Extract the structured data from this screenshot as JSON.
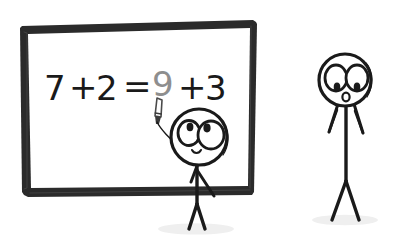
{
  "scene": {
    "title": "Stick figure writing math on a whiteboard",
    "background_color": "#ffffff",
    "width": 400,
    "height": 244
  },
  "whiteboard": {
    "label": "whiteboard",
    "frame_color": "#2b2b2b",
    "surface_color": "#ffffff",
    "equation": {
      "full_text": "7 + 2 = 9 + 3",
      "tokens": [
        {
          "text": "7",
          "state": "written",
          "color": "#1a1a1a"
        },
        {
          "text": "+",
          "state": "written",
          "color": "#1a1a1a"
        },
        {
          "text": "2",
          "state": "written",
          "color": "#1a1a1a"
        },
        {
          "text": "=",
          "state": "written",
          "color": "#1a1a1a"
        },
        {
          "text": "9",
          "state": "being-written",
          "color": "#8e8e8e"
        },
        {
          "text": "+",
          "state": "written",
          "color": "#1a1a1a"
        },
        {
          "text": "3",
          "state": "written",
          "color": "#1a1a1a"
        }
      ],
      "left_operand": "7",
      "right_operand": "2",
      "answer_being_written": "9",
      "trailing_term": "+ 3"
    }
  },
  "characters": [
    {
      "id": "writer",
      "label": "stick figure writing at board",
      "expression": "smiling",
      "eyes": "two large eyes looking up-left",
      "mouth": "small smile",
      "holding": "marker",
      "ink_color": "#1a1a1a"
    },
    {
      "id": "observer",
      "label": "stick figure observing",
      "expression": "surprised",
      "eyes": "two large eyes looking down",
      "mouth": "small open O",
      "holding": "nothing",
      "ink_color": "#1a1a1a"
    }
  ],
  "props": {
    "marker_label": "marker",
    "marker_color": "#4a4a4a",
    "ground_shadow_color": "#e4e4e4"
  }
}
